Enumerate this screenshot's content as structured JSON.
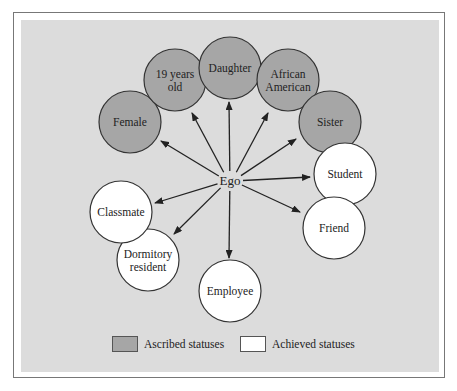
{
  "diagram": {
    "center": {
      "label": "Ego",
      "x": 230,
      "y": 181
    },
    "colors": {
      "ascribed_fill": "#a6a6a6",
      "achieved_fill": "#ffffff",
      "panel_bg": "#dcdcdc",
      "stroke": "#333333"
    },
    "nodes": [
      {
        "id": "female",
        "lines": [
          "Female"
        ],
        "type": "ascribed",
        "cx": 130,
        "cy": 122,
        "ax": 161,
        "ay": 141
      },
      {
        "id": "19-years-old",
        "lines": [
          "19 years",
          "old"
        ],
        "type": "ascribed",
        "cx": 175,
        "cy": 80,
        "ax": 192,
        "ay": 113
      },
      {
        "id": "daughter",
        "lines": [
          "Daughter"
        ],
        "type": "ascribed",
        "cx": 230,
        "cy": 68,
        "ax": 229,
        "ay": 102
      },
      {
        "id": "african-american",
        "lines": [
          "African",
          "American"
        ],
        "type": "ascribed",
        "cx": 288,
        "cy": 80,
        "ax": 268,
        "ay": 113
      },
      {
        "id": "sister",
        "lines": [
          "Sister"
        ],
        "type": "ascribed",
        "cx": 330,
        "cy": 122,
        "ax": 296,
        "ay": 139
      },
      {
        "id": "student",
        "lines": [
          "Student"
        ],
        "type": "achieved",
        "cx": 345,
        "cy": 174,
        "ax": 310,
        "ay": 177
      },
      {
        "id": "friend",
        "lines": [
          "Friend"
        ],
        "type": "achieved",
        "cx": 334,
        "cy": 228,
        "ax": 300,
        "ay": 212
      },
      {
        "id": "employee",
        "lines": [
          "Employee"
        ],
        "type": "achieved",
        "cx": 230,
        "cy": 291,
        "ax": 229,
        "ay": 258
      },
      {
        "id": "dormitory-resident",
        "lines": [
          "Dormitory",
          "resident"
        ],
        "type": "achieved",
        "cx": 148,
        "cy": 260,
        "ax": 174,
        "ay": 234
      },
      {
        "id": "classmate",
        "lines": [
          "Classmate"
        ],
        "type": "achieved",
        "cx": 121,
        "cy": 212,
        "ax": 155,
        "ay": 203
      }
    ],
    "radius": 31
  },
  "legend": {
    "ascribed_label": "Ascribed statuses",
    "achieved_label": "Achieved statuses"
  }
}
